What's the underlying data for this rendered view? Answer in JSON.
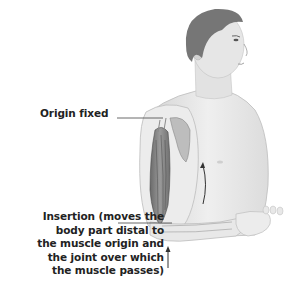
{
  "figure": {
    "colors": {
      "background": "#ffffff",
      "skin": "#e8e8e8",
      "skin_shadow": "#c8c8c8",
      "hair": "#6e6e6e",
      "muscle": "#8a8a8a",
      "muscle_dark": "#5a5a5a",
      "line": "#333333"
    }
  },
  "labels": {
    "origin": "Origin fixed",
    "insertion": [
      "Insertion (moves the",
      "body part distal to",
      "the muscle origin and",
      "the joint over which",
      "the muscle passes)"
    ]
  },
  "arrows": [
    {
      "name": "flexion-arrow",
      "direction": "up",
      "location": "chest, beside upper arm"
    },
    {
      "name": "insertion-force-arrow",
      "direction": "up",
      "location": "below elbow"
    }
  ]
}
